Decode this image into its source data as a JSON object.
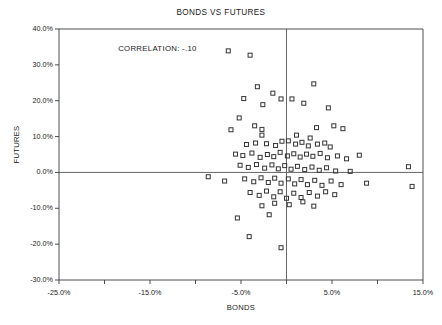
{
  "chart_data": {
    "type": "scatter",
    "title": "BONDS VS FUTURES",
    "xlabel": "BONDS",
    "ylabel": "FUTURES",
    "xlim": [
      -25,
      15
    ],
    "ylim": [
      -30,
      40
    ],
    "grid": false,
    "legend": null,
    "annotations": [
      {
        "text": "CORRELATION: -.10",
        "x": -18.5,
        "y": 34.5
      }
    ],
    "xticks": [
      -25,
      -20,
      -15,
      -10,
      -5,
      0,
      5,
      10,
      15
    ],
    "xtick_labels": [
      "-25.0%",
      "",
      "-15.0%",
      "",
      "-5.0%",
      "",
      "5.0%",
      "",
      "15.0%"
    ],
    "yticks": [
      -30,
      -20,
      -10,
      0,
      10,
      20,
      30,
      40
    ],
    "ytick_labels": [
      "-30.0%",
      "-20.0%",
      "-10.0%",
      "0.0%",
      "10.0%",
      "20.0%",
      "30.0%",
      "40.0%"
    ],
    "zero_lines": {
      "x": 0,
      "y": 0
    },
    "marker": {
      "shape": "open-square",
      "size": 4,
      "color": "#333333"
    },
    "series": [
      {
        "name": "Bonds vs Futures monthly returns",
        "points": [
          [
            -6.4,
            33.9
          ],
          [
            -4.0,
            32.7
          ],
          [
            -3.2,
            23.9
          ],
          [
            -2.6,
            18.9
          ],
          [
            -4.7,
            20.6
          ],
          [
            -1.5,
            22.1
          ],
          [
            -0.6,
            20.5
          ],
          [
            0.6,
            20.5
          ],
          [
            1.9,
            19.3
          ],
          [
            -5.2,
            15.2
          ],
          [
            -3.5,
            13.0
          ],
          [
            -6.1,
            11.9
          ],
          [
            -2.7,
            12.0
          ],
          [
            -2.7,
            10.4
          ],
          [
            1.1,
            10.4
          ],
          [
            3.0,
            24.7
          ],
          [
            4.6,
            18.0
          ],
          [
            5.2,
            13.0
          ],
          [
            6.2,
            12.2
          ],
          [
            3.3,
            12.5
          ],
          [
            2.6,
            9.6
          ],
          [
            -4.4,
            7.8
          ],
          [
            -3.4,
            8.2
          ],
          [
            -2.2,
            8.0
          ],
          [
            -1.2,
            7.5
          ],
          [
            -0.5,
            8.7
          ],
          [
            0.2,
            8.8
          ],
          [
            1.0,
            7.9
          ],
          [
            1.7,
            8.4
          ],
          [
            2.4,
            7.4
          ],
          [
            3.4,
            7.9
          ],
          [
            4.2,
            8.2
          ],
          [
            4.8,
            7.1
          ],
          [
            -5.6,
            5.1
          ],
          [
            -4.8,
            4.7
          ],
          [
            -3.8,
            5.4
          ],
          [
            -2.9,
            4.2
          ],
          [
            -2.1,
            5.0
          ],
          [
            -1.4,
            4.4
          ],
          [
            -0.7,
            5.6
          ],
          [
            0.1,
            4.6
          ],
          [
            0.8,
            5.2
          ],
          [
            1.5,
            4.3
          ],
          [
            2.2,
            5.1
          ],
          [
            2.9,
            4.5
          ],
          [
            3.7,
            5.3
          ],
          [
            4.5,
            4.1
          ],
          [
            5.6,
            4.6
          ],
          [
            6.6,
            3.8
          ],
          [
            8.0,
            4.8
          ],
          [
            13.4,
            1.6
          ],
          [
            -5.1,
            2.0
          ],
          [
            -4.2,
            1.4
          ],
          [
            -3.3,
            2.2
          ],
          [
            -2.4,
            1.2
          ],
          [
            -1.6,
            2.1
          ],
          [
            -0.9,
            1.0
          ],
          [
            -0.2,
            1.9
          ],
          [
            0.5,
            0.9
          ],
          [
            1.2,
            1.7
          ],
          [
            2.0,
            0.8
          ],
          [
            2.8,
            1.5
          ],
          [
            3.6,
            0.6
          ],
          [
            4.4,
            1.3
          ],
          [
            5.4,
            0.4
          ],
          [
            7.0,
            0.3
          ],
          [
            -8.6,
            -1.2
          ],
          [
            -6.8,
            -2.4
          ],
          [
            -4.6,
            -1.8
          ],
          [
            -3.6,
            -2.6
          ],
          [
            -2.8,
            -1.5
          ],
          [
            -2.0,
            -2.8
          ],
          [
            -1.3,
            -1.6
          ],
          [
            -0.6,
            -3.0
          ],
          [
            0.2,
            -1.8
          ],
          [
            0.9,
            -3.2
          ],
          [
            1.6,
            -2.0
          ],
          [
            2.3,
            -3.4
          ],
          [
            3.1,
            -2.2
          ],
          [
            3.9,
            -3.6
          ],
          [
            4.9,
            -2.4
          ],
          [
            6.0,
            -3.4
          ],
          [
            8.8,
            -3.0
          ],
          [
            13.8,
            -3.9
          ],
          [
            -4.0,
            -5.6
          ],
          [
            -3.0,
            -6.4
          ],
          [
            -2.2,
            -5.2
          ],
          [
            -1.4,
            -6.8
          ],
          [
            -0.7,
            -5.4
          ],
          [
            0.0,
            -7.2
          ],
          [
            0.8,
            -5.8
          ],
          [
            1.6,
            -7.0
          ],
          [
            2.5,
            -5.6
          ],
          [
            3.4,
            -6.6
          ],
          [
            4.3,
            -5.4
          ],
          [
            5.3,
            -6.2
          ],
          [
            -2.7,
            -9.3
          ],
          [
            -1.3,
            -8.6
          ],
          [
            0.3,
            -9.0
          ],
          [
            1.8,
            -8.2
          ],
          [
            3.0,
            -9.4
          ],
          [
            -1.9,
            -11.8
          ],
          [
            -5.4,
            -12.7
          ],
          [
            -4.1,
            -17.9
          ],
          [
            -0.6,
            -21.0
          ]
        ]
      }
    ]
  }
}
